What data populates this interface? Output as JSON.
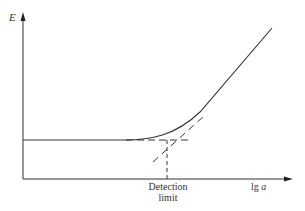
{
  "diagram": {
    "type": "calibration-curve",
    "y_axis_label": "E",
    "x_axis_label_prefix": "lg ",
    "x_axis_label_var": "a",
    "annotation_line1": "Detection",
    "annotation_line2": "limit",
    "colors": {
      "line": "#333333",
      "background": "#ffffff"
    },
    "elements": [
      "y-axis with arrow",
      "x-axis with arrow",
      "solid curve: flat baseline then rising linear region",
      "dashed horizontal extrapolation of baseline",
      "dashed extrapolation of linear region",
      "dashed vertical drop at intersection to x-axis (detection limit)"
    ]
  }
}
